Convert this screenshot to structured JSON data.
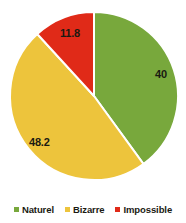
{
  "chart_data": {
    "type": "pie",
    "title": "",
    "categories": [
      "Naturel",
      "Bizarre",
      "Impossible"
    ],
    "values": [
      40,
      48.2,
      11.8
    ],
    "labels": [
      "40",
      "48.2",
      "11.8"
    ],
    "colors": [
      "#78A83C",
      "#EDC43C",
      "#E02A18"
    ],
    "legend_position": "bottom",
    "grid": false,
    "start_angle_deg": 0,
    "direction": "clockwise",
    "slice_separator_color": "#ffffff",
    "background": "#ffffff",
    "label_color": "#1a1a12"
  },
  "pie": {
    "slices": [
      {
        "name": "Naturel",
        "label": "40",
        "value": 40,
        "color": "#78A83C"
      },
      {
        "name": "Bizarre",
        "label": "48.2",
        "value": 48.2,
        "color": "#EDC43C"
      },
      {
        "name": "Impossible",
        "label": "11.8",
        "value": 11.8,
        "color": "#E02A18"
      }
    ]
  },
  "legend": {
    "items": [
      {
        "label": "Naturel",
        "color": "#78A83C"
      },
      {
        "label": "Bizarre",
        "color": "#EDC43C"
      },
      {
        "label": "Impossible",
        "color": "#E02A18"
      }
    ]
  }
}
